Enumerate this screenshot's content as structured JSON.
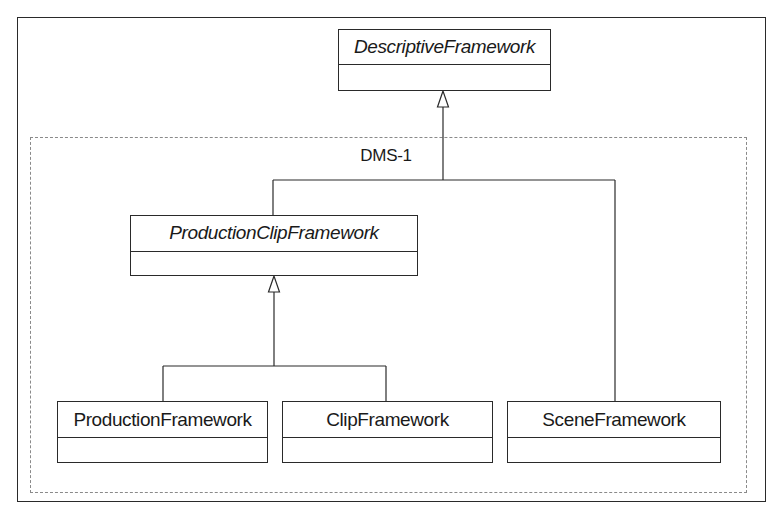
{
  "diagram": {
    "type": "uml-class-diagram",
    "package": {
      "label": "DMS-1"
    },
    "classes": [
      {
        "id": "descriptive",
        "name": "DescriptiveFramework",
        "abstract": true
      },
      {
        "id": "production_clip",
        "name": "ProductionClipFramework",
        "abstract": true
      },
      {
        "id": "production",
        "name": "ProductionFramework",
        "abstract": false
      },
      {
        "id": "clip",
        "name": "ClipFramework",
        "abstract": false
      },
      {
        "id": "scene",
        "name": "SceneFramework",
        "abstract": false
      }
    ],
    "relationships": [
      {
        "type": "generalization",
        "from": "ProductionClipFramework",
        "to": "DescriptiveFramework"
      },
      {
        "type": "generalization",
        "from": "SceneFramework",
        "to": "DescriptiveFramework"
      },
      {
        "type": "generalization",
        "from": "ProductionFramework",
        "to": "ProductionClipFramework"
      },
      {
        "type": "generalization",
        "from": "ClipFramework",
        "to": "ProductionClipFramework"
      }
    ],
    "colors": {
      "line": "#2a2a2a",
      "package_border": "#8a8a8a",
      "background": "#ffffff"
    }
  }
}
